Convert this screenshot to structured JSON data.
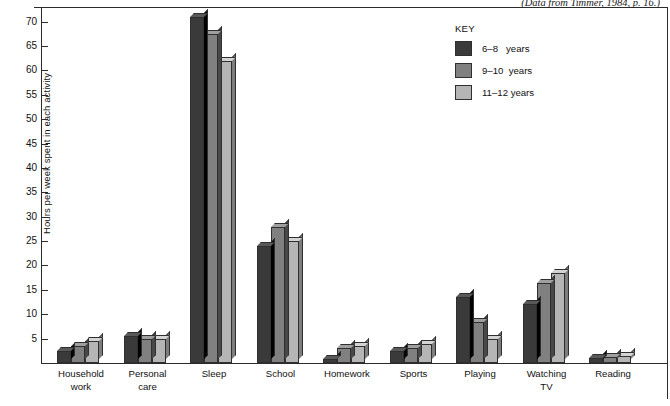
{
  "source_credit": "(Data from Timmer, 1984, p. 16.)",
  "legend": {
    "title": "KEY",
    "entries": [
      {
        "label": "6–8   years",
        "color": "#3a3a3a"
      },
      {
        "label": "9–10  years",
        "color": "#808080"
      },
      {
        "label": "11–12 years",
        "color": "#b5b5b5"
      }
    ]
  },
  "chart_data": {
    "type": "bar",
    "title": "",
    "xlabel": "",
    "ylabel": "Hours per week spent in each activity",
    "ylim": [
      0,
      73
    ],
    "yticks": [
      5,
      10,
      15,
      20,
      25,
      30,
      35,
      40,
      45,
      50,
      55,
      60,
      65,
      70
    ],
    "grid": false,
    "legend_position": "top-right",
    "categories": [
      "Household\nwork",
      "Personal\ncare",
      "Sleep",
      "School",
      "Homework",
      "Sports",
      "Playing",
      "Watching\nTV",
      "Reading"
    ],
    "series": [
      {
        "name": "6–8   years",
        "color": "#3a3a3a",
        "values": [
          2.5,
          5.5,
          71,
          24,
          0.8,
          2.5,
          13.5,
          12,
          1
        ]
      },
      {
        "name": "9–10  years",
        "color": "#808080",
        "values": [
          3.5,
          5.0,
          67.5,
          27.8,
          3.0,
          3.0,
          8.5,
          16.5,
          1.2
        ]
      },
      {
        "name": "11–12 years",
        "color": "#b5b5b5",
        "values": [
          4.5,
          5.0,
          62,
          25,
          3.5,
          3.8,
          5.0,
          18.5,
          1.5
        ]
      }
    ]
  }
}
